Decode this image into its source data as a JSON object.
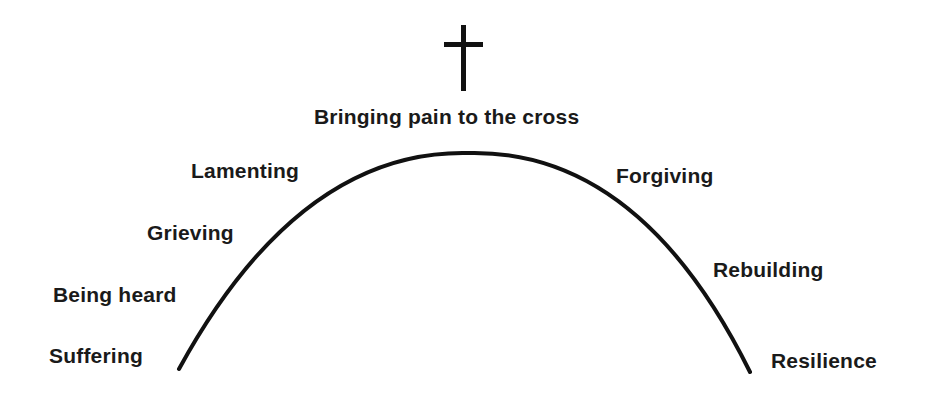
{
  "diagram": {
    "type": "arc-progression",
    "symbol": "cross-icon",
    "apex_label": "Bringing pain to the cross",
    "left_side": [
      "Suffering",
      "Being heard",
      "Grieving",
      "Lamenting"
    ],
    "right_side": [
      "Forgiving",
      "Rebuilding",
      "Resilience"
    ],
    "colors": {
      "line": "#111111",
      "text": "#1a1a1a",
      "background": "#ffffff"
    }
  }
}
